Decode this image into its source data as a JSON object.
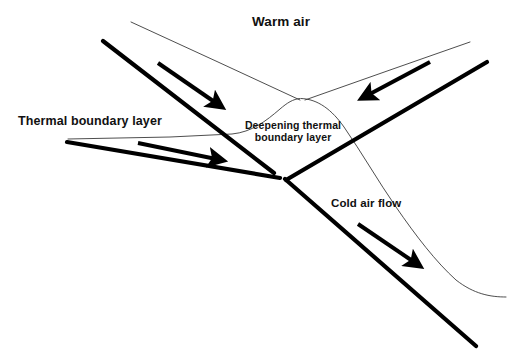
{
  "diagram": {
    "title_label": "Warm air",
    "labels": {
      "warm_air": "Warm air",
      "thermal_boundary_layer": "Thermal boundary layer",
      "deepening_line1": "Deepening thermal",
      "deepening_line2": "boundary layer",
      "cold_air_flow": "Cold air flow"
    },
    "colors": {
      "background": "#ffffff",
      "ink": "#000000",
      "thin_line": "#3a3a3a",
      "text": "#111111"
    },
    "geometry": {
      "canvas": {
        "width": 522,
        "height": 362
      },
      "triple_point": {
        "x": 283,
        "y": 178
      },
      "thick_fronts": [
        {
          "name": "upper-left-front",
          "x1": 103,
          "y1": 41,
          "x2": 274,
          "y2": 173,
          "width": 4.2
        },
        {
          "name": "lower-left-front",
          "x1": 67,
          "y1": 142,
          "x2": 280,
          "y2": 178,
          "width": 4.2
        },
        {
          "name": "upper-right-front",
          "x1": 487,
          "y1": 62,
          "x2": 286,
          "y2": 180,
          "width": 4.2
        },
        {
          "name": "lower-right-front",
          "x1": 285,
          "y1": 179,
          "x2": 476,
          "y2": 346,
          "width": 4.2
        }
      ],
      "thin_boundary_paths": [
        {
          "name": "warm-sector-left-edge",
          "d": "M 131 22 L 300 100"
        },
        {
          "name": "warm-sector-right-edge",
          "d": "M 470 42 L 305 100"
        },
        {
          "name": "thermal-layer-left",
          "d": "M 68 139 L 200 136 L 235 134 C 255 131 270 118 283 107 C 289 102 294 99 300 99"
        },
        {
          "name": "deepening-layer-right",
          "d": "M 303 99 C 322 100 336 112 348 130 C 366 158 382 186 400 212 C 420 240 440 265 460 283 C 478 295 492 297 506 297"
        }
      ],
      "flow_arrows": [
        {
          "name": "warm-inflow-upper-left",
          "x1": 158,
          "y1": 63,
          "x2": 222,
          "y2": 107,
          "direction": "down-right"
        },
        {
          "name": "warm-inflow-lower-left",
          "x1": 138,
          "y1": 143,
          "x2": 224,
          "y2": 161,
          "direction": "right"
        },
        {
          "name": "cold-inflow-upper-right",
          "x1": 430,
          "y1": 62,
          "x2": 361,
          "y2": 99,
          "direction": "down-left"
        },
        {
          "name": "cold-outflow-lower-right",
          "x1": 358,
          "y1": 224,
          "x2": 421,
          "y2": 267,
          "direction": "down-right"
        }
      ]
    }
  }
}
